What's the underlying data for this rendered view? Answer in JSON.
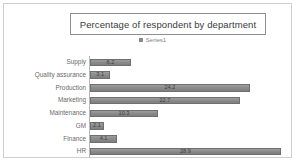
{
  "frame": {
    "name": "chart-frame"
  },
  "legend": {
    "swatch_icon": "legend-square-icon",
    "entries": [
      "Series1"
    ]
  },
  "chart_data": {
    "type": "bar",
    "orientation": "horizontal",
    "title": "Percentage of respondent by department",
    "xlabel": "",
    "ylabel": "",
    "legend": [
      "Series1"
    ],
    "legend_position": "top-center",
    "grid": false,
    "xlim": [
      0,
      30
    ],
    "categories": [
      "Supply",
      "Quality assurance",
      "Production",
      "Marketing",
      "Maintenance",
      "GM",
      "Finance",
      "HR"
    ],
    "values": [
      6.2,
      3.1,
      24.2,
      22.7,
      10.3,
      2.1,
      4.1,
      28.9
    ],
    "value_labels": [
      "6.2",
      "3.1",
      "24.2",
      "22.7",
      "10.3",
      "2.1",
      "4.1",
      "28.9"
    ],
    "series": [
      {
        "name": "Series1",
        "values": [
          6.2,
          3.1,
          24.2,
          22.7,
          10.3,
          2.1,
          4.1,
          28.9
        ]
      }
    ],
    "colors": {
      "bar_fill": "#8c8c8c",
      "bar_border": "#6f6f6f",
      "axis_line": "#b9b9b9",
      "title_border": "#8f8f8f",
      "frame_border": "#cfcfcf",
      "background": "#ffffff",
      "text": "#5d5d5d"
    }
  }
}
